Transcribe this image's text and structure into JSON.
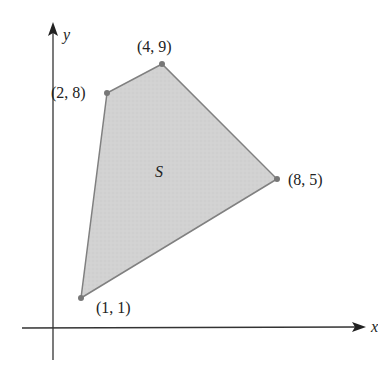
{
  "diagram": {
    "axes": {
      "x_label": "x",
      "y_label": "y",
      "origin_px": [
        53,
        328
      ],
      "x_axis_px": {
        "x1": 22,
        "x2": 360,
        "y": 328
      },
      "y_axis_px": {
        "x": 53,
        "y1": 22,
        "y2": 360
      },
      "color": "#333333"
    },
    "region": {
      "label": "S",
      "label_px": [
        160,
        176
      ],
      "fill": "#cfcfcf",
      "stroke": "#808080"
    },
    "vertices": [
      {
        "label": "(1, 1)",
        "x": 1,
        "y": 1,
        "px": [
          81,
          298
        ],
        "label_px": [
          96,
          313
        ]
      },
      {
        "label": "(8, 5)",
        "x": 8,
        "y": 5,
        "px": [
          277,
          179
        ],
        "label_px": [
          288,
          185
        ]
      },
      {
        "label": "(4, 9)",
        "x": 4,
        "y": 9,
        "px": [
          162,
          64
        ],
        "label_px": [
          137,
          52
        ]
      },
      {
        "label": "(2, 8)",
        "x": 2,
        "y": 8,
        "px": [
          107,
          93
        ],
        "label_px": [
          50,
          98
        ]
      }
    ],
    "vertex_color": "#777777"
  }
}
